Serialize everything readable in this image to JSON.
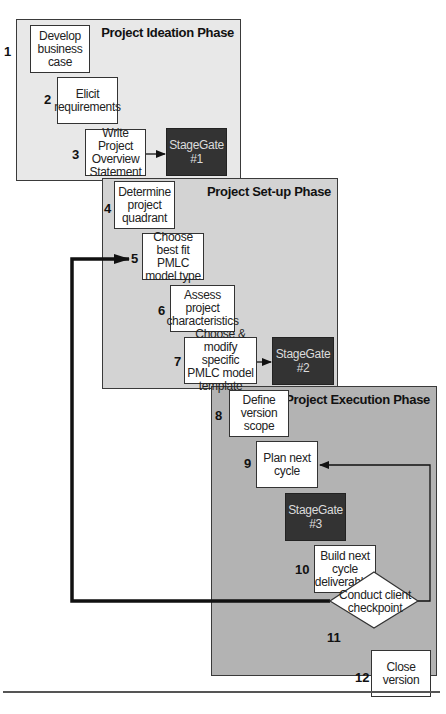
{
  "phases": [
    {
      "title": "Project Ideation Phase",
      "steps": [
        {
          "num": "1",
          "label": "Develop business case"
        },
        {
          "num": "2",
          "label": "Elicit requirements"
        },
        {
          "num": "3",
          "label": "Write Project Overview Statement"
        }
      ],
      "gate": {
        "line1": "StageGate",
        "line2": "#1"
      }
    },
    {
      "title": "Project Set-up Phase",
      "steps": [
        {
          "num": "4",
          "label": "Determine project quadrant"
        },
        {
          "num": "5",
          "label": "Choose best fit PMLC model type"
        },
        {
          "num": "6",
          "label": "Assess project characteristics"
        },
        {
          "num": "7",
          "label": "Choose & modify specific PMLC model template"
        }
      ],
      "gate": {
        "line1": "StageGate",
        "line2": "#2"
      }
    },
    {
      "title": "Project Execution Phase",
      "steps": [
        {
          "num": "8",
          "label": "Define version scope"
        },
        {
          "num": "9",
          "label": "Plan next cycle"
        },
        {
          "num": "10",
          "label": "Build next cycle deliverables"
        },
        {
          "num": "11",
          "label": "Conduct client checkpoint"
        },
        {
          "num": "12",
          "label": "Close version"
        }
      ],
      "gate": {
        "line1": "StageGate",
        "line2": "#3"
      }
    }
  ],
  "colors": {
    "phase1_bg": "#e8e8e8",
    "phase2_bg": "#d3d3d3",
    "phase3_bg": "#b3b3b3",
    "gate_bg": "#333333",
    "gate_text": "#dcdcdc"
  }
}
